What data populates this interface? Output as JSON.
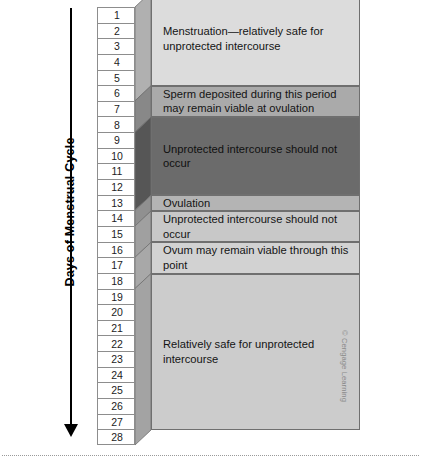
{
  "figure": {
    "axis": {
      "title": "Days of Menstrual Cycle",
      "arrow_icon": "down-arrow-icon",
      "days": [
        1,
        2,
        3,
        4,
        5,
        6,
        7,
        8,
        9,
        10,
        11,
        12,
        13,
        14,
        15,
        16,
        17,
        18,
        19,
        20,
        21,
        22,
        23,
        24,
        25,
        26,
        27,
        28
      ]
    },
    "credit": "© Cengage Learning"
  },
  "chart_data": {
    "type": "table",
    "title": "Days of Menstrual Cycle",
    "ylabel": "Days of Menstrual Cycle",
    "xlabel": "",
    "categories": [
      "1",
      "2",
      "3",
      "4",
      "5",
      "6",
      "7",
      "8",
      "9",
      "10",
      "11",
      "12",
      "13",
      "14",
      "15",
      "16",
      "17",
      "18",
      "19",
      "20",
      "21",
      "22",
      "23",
      "24",
      "25",
      "26",
      "27",
      "28"
    ],
    "ylim": [
      1,
      28
    ],
    "grid": false,
    "legend": "none",
    "bands": [
      {
        "label": "Menstruation—relatively safe for\nunprotected intercourse",
        "day_start": 1,
        "day_end": 6,
        "color": "#dcdcdc",
        "shade": "light"
      },
      {
        "label": "Sperm deposited during this period\nmay remain viable at ovulation",
        "day_start": 7,
        "day_end": 8,
        "color": "#aaaaaa",
        "shade": "medium"
      },
      {
        "label": "Unprotected intercourse should not occur",
        "day_start": 9,
        "day_end": 13,
        "color": "#6b6b6b",
        "shade": "dark"
      },
      {
        "label": "Ovulation",
        "day_start": 14,
        "day_end": 14,
        "color": "#b4b4b4",
        "shade": "medium"
      },
      {
        "label": "Unprotected intercourse should not occur",
        "day_start": 15,
        "day_end": 16,
        "color": "#c8c8c8",
        "shade": "light-medium"
      },
      {
        "label": "Ovum may remain viable through this point",
        "day_start": 17,
        "day_end": 18,
        "color": "#d2d2d2",
        "shade": "light"
      },
      {
        "label": "Relatively safe for unprotected intercourse",
        "day_start": 19,
        "day_end": 28,
        "color": "#cccccc",
        "shade": "light"
      }
    ]
  }
}
